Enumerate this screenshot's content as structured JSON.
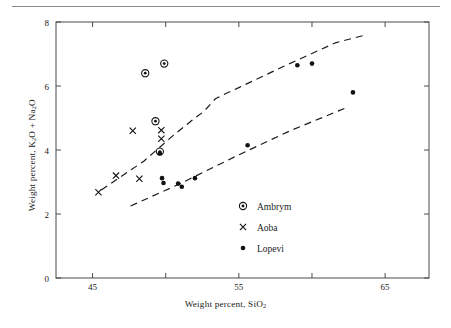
{
  "figure": {
    "type": "scatter-plot",
    "x_axis_label": "Weight percent, SiO",
    "x_axis_label_sub": "2",
    "y_axis_label_pre": "Weight percent, K",
    "y_axis_label_sub1": "2",
    "y_axis_label_mid": "O + Na",
    "y_axis_label_sub2": "2",
    "y_axis_label_post": "O"
  },
  "chart_data": {
    "type": "scatter",
    "title": "",
    "xlabel": "Weight percent, SiO2",
    "ylabel": "Weight percent, K2O + Na2O",
    "xlim": [
      42.5,
      68.0
    ],
    "ylim": [
      0,
      8
    ],
    "xticks": [
      45,
      50,
      55,
      60,
      65
    ],
    "xticklabels": [
      "45",
      "",
      "55",
      "",
      "65"
    ],
    "yticks": [
      0,
      2,
      4,
      6,
      8
    ],
    "yticklabels": [
      "0",
      "2",
      "4",
      "6",
      "8"
    ],
    "grid": false,
    "legend_position": "lower-right-inside",
    "series": [
      {
        "name": "Ambrym",
        "marker": "circle-dot",
        "color": "#1a1a1a",
        "points": [
          {
            "x": 48.6,
            "y": 6.4
          },
          {
            "x": 49.9,
            "y": 6.7
          },
          {
            "x": 49.3,
            "y": 4.9
          },
          {
            "x": 49.6,
            "y": 3.95
          }
        ]
      },
      {
        "name": "Aoba",
        "marker": "x",
        "color": "#1a1a1a",
        "points": [
          {
            "x": 45.4,
            "y": 2.68
          },
          {
            "x": 46.6,
            "y": 3.2
          },
          {
            "x": 47.75,
            "y": 4.6
          },
          {
            "x": 48.2,
            "y": 3.1
          },
          {
            "x": 49.7,
            "y": 4.62
          },
          {
            "x": 49.7,
            "y": 4.35
          }
        ]
      },
      {
        "name": "Lopevi",
        "marker": "dot",
        "color": "#1a1a1a",
        "points": [
          {
            "x": 49.6,
            "y": 3.9
          },
          {
            "x": 49.75,
            "y": 3.12
          },
          {
            "x": 49.85,
            "y": 2.97
          },
          {
            "x": 50.85,
            "y": 2.95
          },
          {
            "x": 51.1,
            "y": 2.85
          },
          {
            "x": 52.0,
            "y": 3.12
          },
          {
            "x": 55.6,
            "y": 4.15
          },
          {
            "x": 59.0,
            "y": 6.65
          },
          {
            "x": 60.0,
            "y": 6.7
          },
          {
            "x": 62.8,
            "y": 5.8
          }
        ]
      }
    ],
    "reference_lines": [
      {
        "name": "upper-alkaline-boundary",
        "style": "dashed",
        "points": [
          {
            "x": 45.6,
            "y": 2.75
          },
          {
            "x": 48.5,
            "y": 3.65
          },
          {
            "x": 50.5,
            "y": 4.45
          },
          {
            "x": 52.0,
            "y": 5.0
          },
          {
            "x": 52.6,
            "y": 5.2
          },
          {
            "x": 53.4,
            "y": 5.6
          },
          {
            "x": 53.9,
            "y": 5.72
          },
          {
            "x": 55.0,
            "y": 5.95
          },
          {
            "x": 58.0,
            "y": 6.6
          },
          {
            "x": 61.6,
            "y": 7.35
          },
          {
            "x": 63.7,
            "y": 7.6
          }
        ]
      },
      {
        "name": "lower-alkaline-boundary",
        "style": "dashed",
        "points": [
          {
            "x": 47.6,
            "y": 2.25
          },
          {
            "x": 51.0,
            "y": 2.95
          },
          {
            "x": 55.0,
            "y": 3.85
          },
          {
            "x": 58.5,
            "y": 4.6
          },
          {
            "x": 62.5,
            "y": 5.35
          }
        ]
      }
    ],
    "legend": [
      {
        "label": "Ambrym",
        "marker": "circle-dot"
      },
      {
        "label": "Aoba",
        "marker": "x"
      },
      {
        "label": "Lopevi",
        "marker": "dot"
      }
    ]
  }
}
